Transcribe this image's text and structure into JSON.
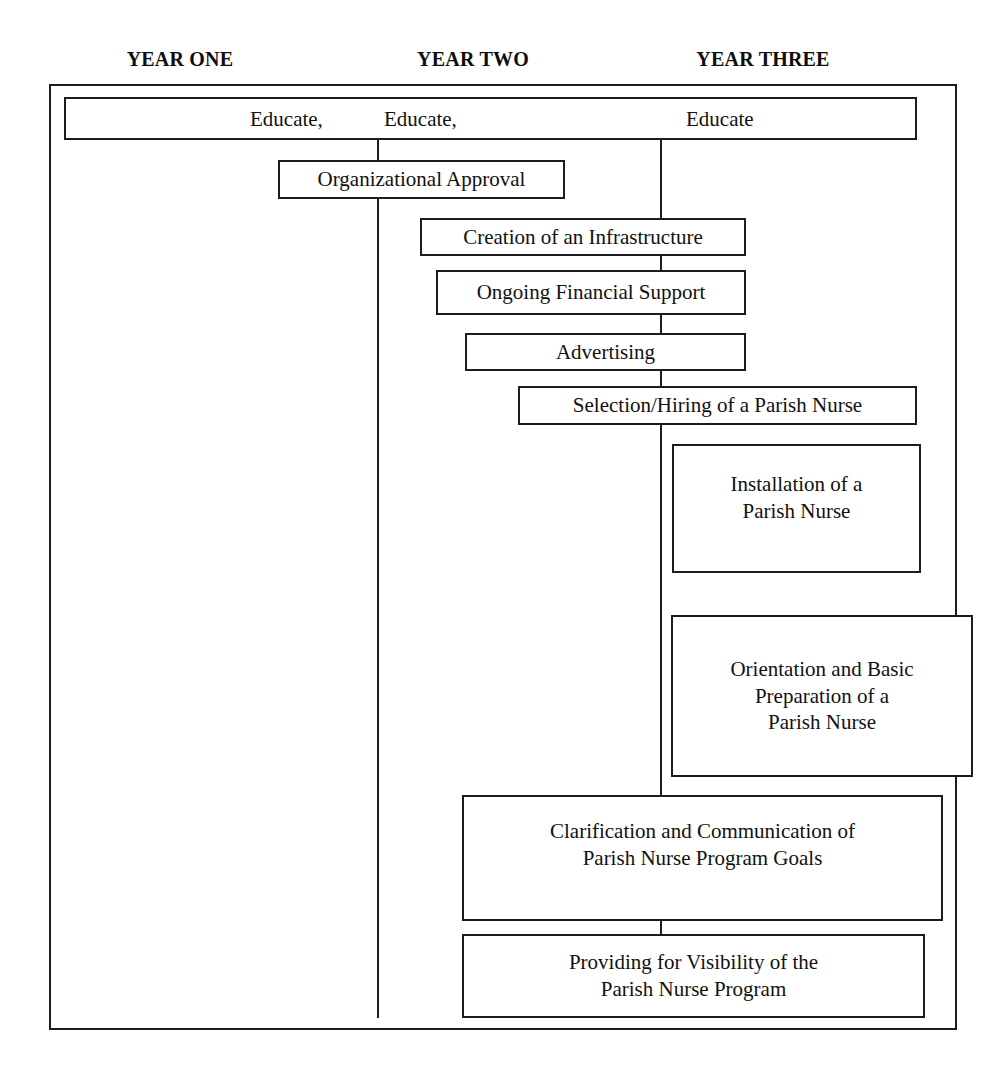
{
  "diagram": {
    "line_color": "#1c1c1c",
    "background": "#ffffff",
    "text_color": "#111111"
  },
  "columns": [
    {
      "id": "year-one",
      "label": "YEAR ONE"
    },
    {
      "id": "year-two",
      "label": "YEAR TWO"
    },
    {
      "id": "year-three",
      "label": "YEAR THREE"
    }
  ],
  "banner": {
    "words": [
      {
        "id": "educate-1",
        "text": "Educate,"
      },
      {
        "id": "educate-2",
        "text": "Educate,"
      },
      {
        "id": "educate-3",
        "text": "Educate"
      }
    ]
  },
  "steps": [
    {
      "id": "organizational-approval",
      "text": "Organizational Approval"
    },
    {
      "id": "creation-of-infrastructure",
      "text": "Creation of an Infrastructure"
    },
    {
      "id": "ongoing-financial-support",
      "text": "Ongoing Financial Support"
    },
    {
      "id": "advertising",
      "text": "Advertising"
    },
    {
      "id": "selection-hiring",
      "text": "Selection/Hiring of a Parish Nurse"
    },
    {
      "id": "installation",
      "text": "Installation of a\nParish Nurse"
    },
    {
      "id": "orientation-preparation",
      "text": "Orientation and Basic\nPreparation of a\nParish Nurse"
    },
    {
      "id": "clarification-communication",
      "text": "Clarification and Communication of\nParish Nurse Program Goals"
    },
    {
      "id": "providing-visibility",
      "text": "Providing for Visibility of the\nParish Nurse Program"
    }
  ]
}
